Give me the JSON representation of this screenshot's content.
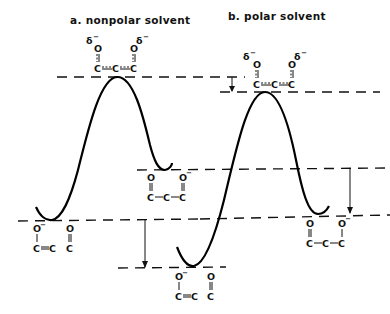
{
  "titles": {
    "a": "a. nonpolar solvent",
    "b": "b. polar solvent"
  },
  "atoms": {
    "O": "O",
    "C": "C",
    "delta": "δ",
    "minus": "−"
  },
  "structures": {
    "ts_a": {
      "label": "C=C=C transition state with δ− on both O (nonpolar)"
    },
    "ts_b": {
      "label": "C=C=C transition state with δ− on both O (polar)"
    },
    "reactant_a": {
      "label": "O− / C=C  + O=C (reactant, nonpolar)"
    },
    "product_a": {
      "label": "O=C–C–C–O− (product, nonpolar)"
    },
    "reactant_b": {
      "label": "O− / C=C  + O=C (reactant, polar)"
    },
    "product_b": {
      "label": "O=C–C–C–O− (product, polar)"
    }
  },
  "levels": {
    "ts_nonpolar_y": 77,
    "ts_polar_y": 92,
    "product_nonpolar_y": 169,
    "reactant_nonpolar_y": 219,
    "product_polar_y": 214,
    "reactant_polar_y": 268
  },
  "arrows": [
    {
      "name": "ts-shift-arrow",
      "x": 232,
      "from_y": 77,
      "to_y": 92
    },
    {
      "name": "reactant-shift-arrow",
      "x": 145,
      "from_y": 219,
      "to_y": 268
    },
    {
      "name": "product-shift-arrow",
      "x": 350,
      "from_y": 169,
      "to_y": 214
    }
  ],
  "colors": {
    "ink": "#111111",
    "background": "#ffffff"
  }
}
